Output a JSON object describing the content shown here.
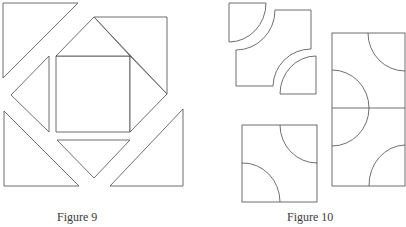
{
  "figures": [
    {
      "id": "figure-9",
      "caption": "Figure 9",
      "description": "Quilt block pieces: a central square surrounded by four small triangles and four large corner triangles, shown separated",
      "pieces": {
        "center_square": 1,
        "small_triangles": 4,
        "large_corner_triangles": 4
      }
    },
    {
      "id": "figure-10",
      "caption": "Figure 10",
      "description": "Curved-seam quilt pieces: two quarter-circle pieces and one concave-cornered piece, an assembled square block, and two assembled blocks joined vertically",
      "pieces": {
        "quarter_circles": 2,
        "concave_square": 1,
        "assembled_square": 1,
        "joined_blocks": 2
      }
    }
  ],
  "colors": {
    "stroke": "#4a4a4a",
    "fill": "#ffffff",
    "caption": "#3a3a3a"
  }
}
